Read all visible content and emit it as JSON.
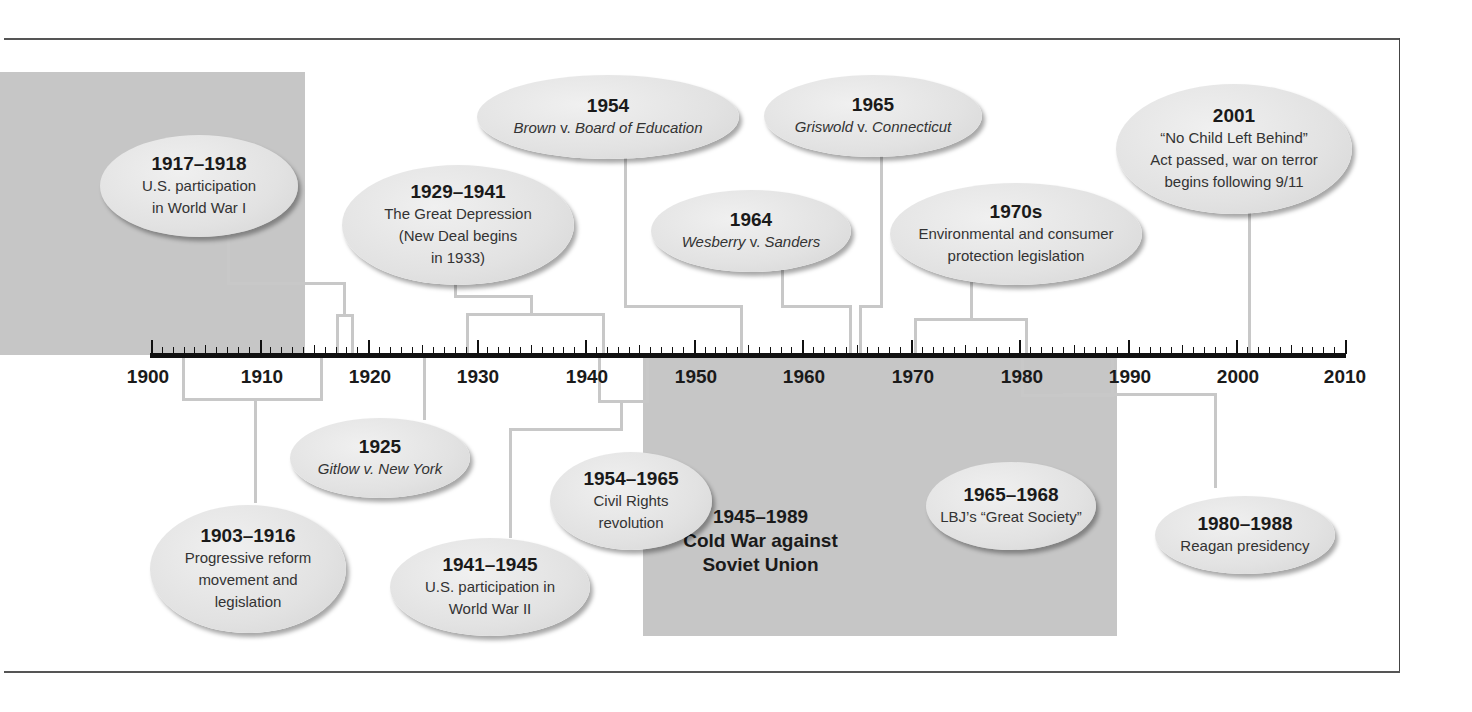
{
  "chart_data": {
    "type": "timeline",
    "title": "",
    "axis": {
      "start": 1900,
      "end": 2010,
      "major_step": 10,
      "minor_step": 1,
      "tick_labels": [
        "1900",
        "1910",
        "1920",
        "1930",
        "1940",
        "1950",
        "1960",
        "1970",
        "1980",
        "1990",
        "2000",
        "2010"
      ]
    },
    "shaded_periods": [
      {
        "start": 1900,
        "end": 1914,
        "label": ""
      },
      {
        "start": 1945,
        "end": 1989,
        "label": "1945–1989 Cold War against Soviet Union"
      }
    ],
    "events": [
      {
        "date": "1917–1918",
        "text": "U.S. participation in World War I",
        "side": "above"
      },
      {
        "date": "1929–1941",
        "text": "The Great Depression (New Deal begins in 1933)",
        "side": "above"
      },
      {
        "date": "1954",
        "text": "Brown v. Board of Education",
        "side": "above"
      },
      {
        "date": "1964",
        "text": "Wesberry v. Sanders",
        "side": "above"
      },
      {
        "date": "1965",
        "text": "Griswold v. Connecticut",
        "side": "above"
      },
      {
        "date": "1970s",
        "text": "Environmental and consumer protection legislation",
        "side": "above"
      },
      {
        "date": "2001",
        "text": "“No Child Left Behind” Act passed, war on terror begins following 9/11",
        "side": "above"
      },
      {
        "date": "1903–1916",
        "text": "Progressive reform movement and legislation",
        "side": "below"
      },
      {
        "date": "1925",
        "text": "Gitlow v. New York",
        "side": "below"
      },
      {
        "date": "1941–1945",
        "text": "U.S. participation in World War II",
        "side": "below"
      },
      {
        "date": "1954–1965",
        "text": "Civil Rights revolution",
        "side": "below"
      },
      {
        "date": "1965–1968",
        "text": "LBJ’s “Great Society”",
        "side": "below"
      },
      {
        "date": "1980–1988",
        "text": "Reagan presidency",
        "side": "below"
      }
    ]
  },
  "axis_labels": [
    "1900",
    "1910",
    "1920",
    "1930",
    "1940",
    "1950",
    "1960",
    "1970",
    "1980",
    "1990",
    "2000",
    "2010"
  ],
  "cold_war": {
    "years": "1945–1989",
    "line1": "Cold War against",
    "line2": "Soviet Union"
  },
  "bubbles": {
    "wwi": {
      "yr": "1917–1918",
      "l1": "U.S. participation",
      "l2": "in World War I"
    },
    "depression": {
      "yr": "1929–1941",
      "l1": "The Great Depression",
      "l2": "(New Deal begins",
      "l3": "in 1933)"
    },
    "brown": {
      "yr": "1954",
      "l1a": "Brown",
      "l1b": " v. ",
      "l1c": "Board of Education"
    },
    "wesberry": {
      "yr": "1964",
      "l1a": "Wesberry",
      "l1b": " v. ",
      "l1c": "Sanders"
    },
    "griswold": {
      "yr": "1965",
      "l1a": "Griswold",
      "l1b": " v. ",
      "l1c": "Connecticut"
    },
    "seventies": {
      "yr": "1970s",
      "l1": "Environmental and consumer",
      "l2": "protection legislation"
    },
    "nclb": {
      "yr": "2001",
      "l1": "“No Child Left Behind”",
      "l2": "Act passed, war on terror",
      "l3": "begins following 9/11"
    },
    "progressive": {
      "yr": "1903–1916",
      "l1": "Progressive reform",
      "l2": "movement and",
      "l3": "legislation"
    },
    "gitlow": {
      "yr": "1925",
      "l1a": "Gitlow",
      "l1b": " v. ",
      "l1c": "New York"
    },
    "wwii": {
      "yr": "1941–1945",
      "l1": "U.S. participation in",
      "l2": "World War II"
    },
    "civil": {
      "yr": "1954–1965",
      "l1": "Civil Rights",
      "l2": "revolution"
    },
    "lbj": {
      "yr": "1965–1968",
      "l1": "LBJ’s “Great Society”"
    },
    "reagan": {
      "yr": "1980–1988",
      "l1": "Reagan presidency"
    }
  },
  "colors": {
    "shade": "#c6c6c6",
    "bubble": "#e2e2e2",
    "connector": "#c8c8c8",
    "axis": "#111111"
  }
}
